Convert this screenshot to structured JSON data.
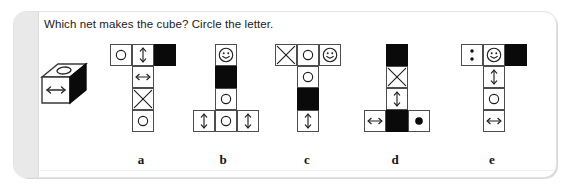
{
  "worksheet": {
    "prompt": "Which net makes the cube? Circle the letter.",
    "reference_cube": {
      "name": "reference-cube",
      "top_face": "circle",
      "front_face": "horizontal-double-arrow",
      "right_face": "black"
    },
    "colors": {
      "ink": "#0a0a0a",
      "cell_stroke": "#4d4d4d",
      "card_background": "#ffffff",
      "card_spine": "#e9e9e9",
      "page_background": "#ffffff"
    },
    "options": [
      {
        "letter": "a",
        "name": "net-option-a",
        "cells": [
          {
            "col": 0,
            "row": 0,
            "glyph": "circle"
          },
          {
            "col": 1,
            "row": 0,
            "glyph": "vertical-double-arrow"
          },
          {
            "col": 2,
            "row": 0,
            "glyph": "black"
          },
          {
            "col": 1,
            "row": 1,
            "glyph": "horizontal-double-arrow"
          },
          {
            "col": 1,
            "row": 2,
            "glyph": "cross"
          },
          {
            "col": 1,
            "row": 3,
            "glyph": "circle"
          }
        ]
      },
      {
        "letter": "b",
        "name": "net-option-b",
        "cells": [
          {
            "col": 1,
            "row": 0,
            "glyph": "smiley"
          },
          {
            "col": 1,
            "row": 1,
            "glyph": "black"
          },
          {
            "col": 1,
            "row": 2,
            "glyph": "circle"
          },
          {
            "col": 0,
            "row": 3,
            "glyph": "vertical-double-arrow"
          },
          {
            "col": 1,
            "row": 3,
            "glyph": "circle"
          },
          {
            "col": 2,
            "row": 3,
            "glyph": "vertical-double-arrow"
          }
        ]
      },
      {
        "letter": "c",
        "name": "net-option-c",
        "cells": [
          {
            "col": 0,
            "row": 0,
            "glyph": "cross"
          },
          {
            "col": 1,
            "row": 0,
            "glyph": "circle"
          },
          {
            "col": 2,
            "row": 0,
            "glyph": "smiley"
          },
          {
            "col": 1,
            "row": 1,
            "glyph": "circle"
          },
          {
            "col": 1,
            "row": 2,
            "glyph": "black"
          },
          {
            "col": 1,
            "row": 3,
            "glyph": "vertical-double-arrow"
          }
        ]
      },
      {
        "letter": "d",
        "name": "net-option-d",
        "cells": [
          {
            "col": 1,
            "row": 0,
            "glyph": "black"
          },
          {
            "col": 1,
            "row": 1,
            "glyph": "cross"
          },
          {
            "col": 1,
            "row": 2,
            "glyph": "vertical-double-arrow"
          },
          {
            "col": 0,
            "row": 3,
            "glyph": "horizontal-double-arrow"
          },
          {
            "col": 1,
            "row": 3,
            "glyph": "black"
          },
          {
            "col": 2,
            "row": 3,
            "glyph": "filled-dot"
          }
        ]
      },
      {
        "letter": "e",
        "name": "net-option-e",
        "cells": [
          {
            "col": 0,
            "row": 0,
            "glyph": "two-dots"
          },
          {
            "col": 1,
            "row": 0,
            "glyph": "smiley"
          },
          {
            "col": 2,
            "row": 0,
            "glyph": "black"
          },
          {
            "col": 1,
            "row": 1,
            "glyph": "vertical-double-arrow"
          },
          {
            "col": 1,
            "row": 2,
            "glyph": "circle"
          },
          {
            "col": 1,
            "row": 3,
            "glyph": "horizontal-double-arrow"
          }
        ]
      }
    ],
    "layout": {
      "net_left_positions": [
        110,
        193,
        275,
        364,
        461
      ],
      "letter_left_positions": [
        121,
        203,
        287,
        375,
        472
      ],
      "cell_size": 22
    }
  }
}
